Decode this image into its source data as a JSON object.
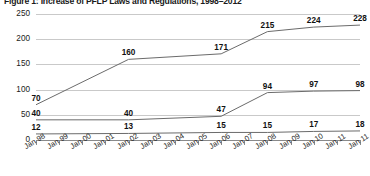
{
  "chart_data": {
    "type": "line",
    "title": "Figure 1: Increase of PFLP Laws and Regulations, 1998–2012",
    "xlabel": "",
    "ylabel": "",
    "ylim": [
      0,
      250
    ],
    "yticks": [
      0,
      50,
      100,
      150,
      200,
      250
    ],
    "grid": true,
    "legend": "none",
    "categories": [
      "Jan 98",
      "Jan 99",
      "Jan 00",
      "Jan 01",
      "Jan 02",
      "Jan 03",
      "Jan 04",
      "Jan 05",
      "Jan 06",
      "Jan 07",
      "Jan 08",
      "Jan 09",
      "Jan 10",
      "Jan 11",
      "Jan 11"
    ],
    "series": [
      {
        "name": "top-series",
        "x": [
          0,
          4,
          8,
          10,
          12,
          14
        ],
        "values": [
          70,
          160,
          171,
          215,
          224,
          228
        ],
        "labels": [
          "70",
          "160",
          "171",
          "215",
          "224",
          "228"
        ]
      },
      {
        "name": "middle-series",
        "x": [
          0,
          4,
          8,
          10,
          12,
          14
        ],
        "values": [
          40,
          40,
          47,
          94,
          97,
          98
        ],
        "labels": [
          "40",
          "40",
          "47",
          "94",
          "97",
          "98"
        ]
      },
      {
        "name": "bottom-series",
        "x": [
          0,
          4,
          8,
          10,
          12,
          14
        ],
        "values": [
          12,
          13,
          15,
          15,
          17,
          18
        ],
        "labels": [
          "12",
          "13",
          "15",
          "15",
          "17",
          "18"
        ]
      }
    ],
    "colors": {
      "line": "#6b6b6b",
      "grid": "#c9c9c9",
      "axis": "#8a8a8a",
      "text": "#1a1a1a"
    }
  }
}
